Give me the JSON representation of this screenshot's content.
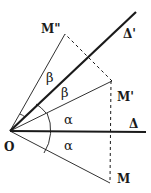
{
  "diagram": {
    "type": "geometry-reflection",
    "points": {
      "O": {
        "label": "O",
        "x": 10,
        "y": 131
      },
      "M": {
        "label": "M",
        "x": 110,
        "y": 183
      },
      "M_prime": {
        "label": "M'",
        "x": 112,
        "y": 81
      },
      "M_double_prime": {
        "label": "M\"",
        "x": 65,
        "y": 34
      }
    },
    "lines": {
      "delta": {
        "label": "Δ",
        "x2": 146,
        "y2": 132
      },
      "delta_prime": {
        "label": "Δ'",
        "x2": 136,
        "y2": 12
      }
    },
    "angles": {
      "alpha_upper": "α",
      "alpha_lower": "α",
      "beta_upper": "β",
      "beta_lower": "β"
    },
    "colors": {
      "stroke": "#1a1a1a",
      "background": "#ffffff"
    }
  }
}
